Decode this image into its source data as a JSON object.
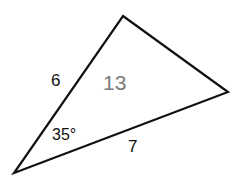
{
  "diagram": {
    "type": "triangle",
    "vertices": {
      "top": [
        123,
        16
      ],
      "right": [
        228,
        92
      ],
      "bottom_left": [
        14,
        173
      ]
    },
    "stroke_color": "#111111",
    "labels": {
      "side_left": "6",
      "side_bottom": "7",
      "area": "13",
      "included_angle": "35°"
    },
    "colors": {
      "edge_label": "#111111",
      "area_label": "#7a7a7a",
      "background": "#ffffff"
    }
  }
}
